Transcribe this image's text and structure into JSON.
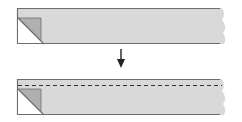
{
  "diagram": {
    "steps": [
      {
        "name": "before",
        "has_fold_line": false
      },
      {
        "name": "after",
        "has_fold_line": true
      }
    ],
    "arrow_direction": "down",
    "colors": {
      "strip_fill": "#d9d9d9",
      "strip_edge": "#6e6e6e",
      "corner_fold": "#b0b0b0",
      "corner_back": "#ffffff",
      "arrow": "#222222",
      "fold_line": "#333333"
    }
  }
}
